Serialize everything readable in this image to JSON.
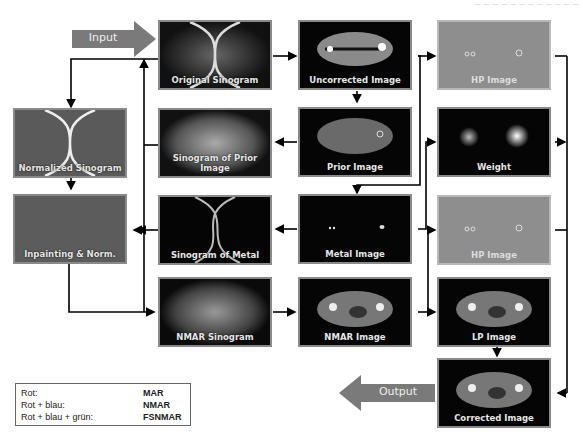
{
  "header": {
    "text": "— — — — — — — — — — — —"
  },
  "input_arrow": {
    "label": "Input",
    "color": "#7a7a7a"
  },
  "output_arrow": {
    "label": "Output",
    "color": "#7a7a7a"
  },
  "boxes": {
    "original_sinogram": {
      "label": "Original Sinogram"
    },
    "uncorrected_image": {
      "label": "Uncorrected Image"
    },
    "hp_image_1": {
      "label": "HP Image"
    },
    "normalized_sinogram": {
      "label": "Normalized Sinogram"
    },
    "sinogram_prior": {
      "label": "Sinogram of Prior Image"
    },
    "prior_image": {
      "label": "Prior Image"
    },
    "weight": {
      "label": "Weight"
    },
    "inpainting_norm": {
      "label": "Inpainting & Norm."
    },
    "sinogram_metal": {
      "label": "Sinogram of Metal"
    },
    "metal_image": {
      "label": "Metal Image"
    },
    "hp_image_2": {
      "label": "HP Image"
    },
    "nmar_sinogram": {
      "label": "NMAR Sinogram"
    },
    "nmar_image": {
      "label": "NMAR Image"
    },
    "lp_image": {
      "label": "LP Image"
    },
    "corrected_image": {
      "label": "Corrected Image"
    }
  },
  "legend": {
    "rows": [
      {
        "key": "Rot:",
        "value": "MAR"
      },
      {
        "key": "Rot + blau:",
        "value": "NMAR"
      },
      {
        "key": "Rot + blau + grün:",
        "value": "FSNMAR"
      }
    ]
  }
}
